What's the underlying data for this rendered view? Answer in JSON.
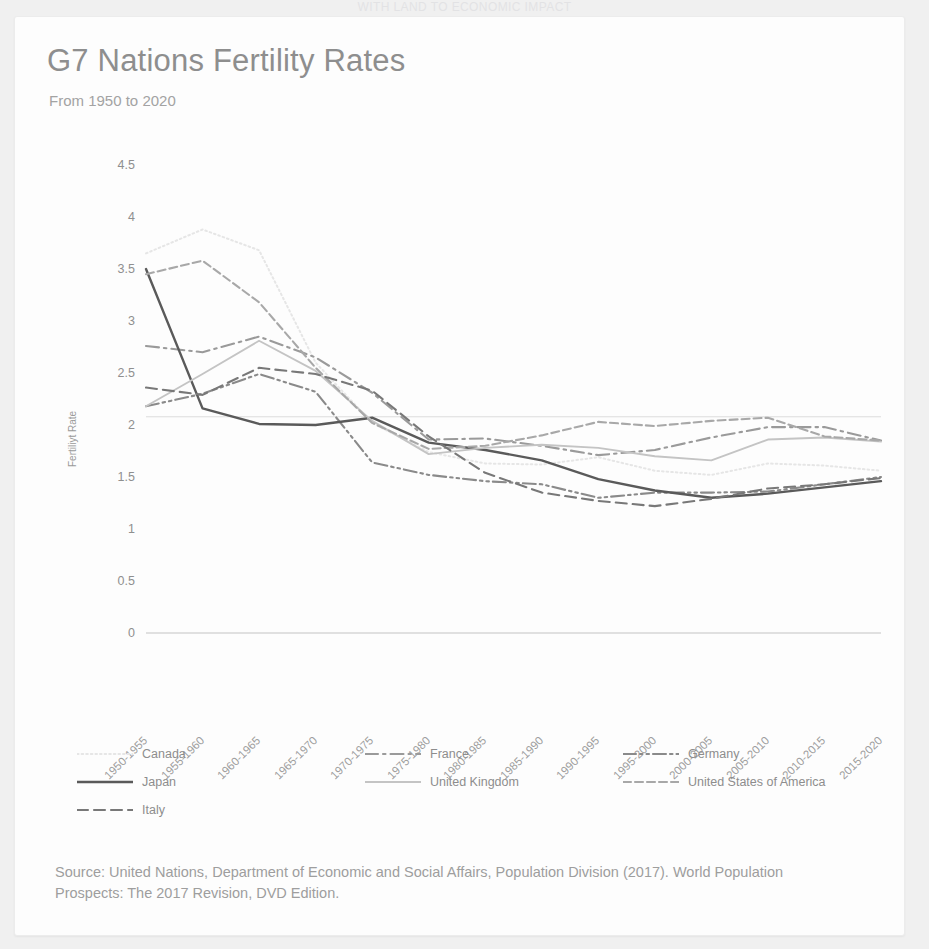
{
  "top_partial_text": "WITH LAND TO ECONOMIC IMPACT",
  "card": {
    "title": "G7 Nations Fertility Rates",
    "subtitle": "From 1950 to 2020",
    "source": "Source: United Nations, Department of Economic and Social Affairs, Population Division (2017). World Population Prospects: The 2017 Revision, DVD Edition."
  },
  "colors": {
    "canada": "#e6e6e6",
    "france": "#9a9a9a",
    "germany": "#8a8a8a",
    "japan": "#5a5a5a",
    "united_kingdom": "#c4c4c4",
    "usa": "#a8a8a8",
    "italy": "#787878",
    "axis": "#d6d6d6",
    "text": "#8f8f8f"
  },
  "chart_data": {
    "type": "line",
    "title": "G7 Nations Fertility Rates",
    "subtitle": "From 1950 to 2020",
    "xlabel": "",
    "ylabel": "Fertiliyt Rate",
    "ylim": [
      0,
      4.5
    ],
    "yticks": [
      0,
      0.5,
      1,
      1.5,
      2,
      2.5,
      3,
      3.5,
      4,
      4.5
    ],
    "grid": false,
    "legend_position": "bottom",
    "categories": [
      "1950-1955",
      "1955-1960",
      "1960-1965",
      "1965-1970",
      "1970-1975",
      "1975-1980",
      "1980-1985",
      "1985-1990",
      "1990-1995",
      "1995-2000",
      "2000-2005",
      "2005-2010",
      "2010-2015",
      "2015-2020"
    ],
    "series": [
      {
        "name": "Canada",
        "style": "dotted",
        "color": "#e6e6e6",
        "values": [
          3.65,
          3.88,
          3.68,
          2.6,
          2.02,
          1.74,
          1.63,
          1.62,
          1.69,
          1.56,
          1.52,
          1.63,
          1.61,
          1.56
        ]
      },
      {
        "name": "France",
        "style": "dash-dot",
        "color": "#9a9a9a",
        "values": [
          2.76,
          2.7,
          2.85,
          2.65,
          2.31,
          1.86,
          1.87,
          1.8,
          1.71,
          1.76,
          1.88,
          1.98,
          1.98,
          1.85
        ]
      },
      {
        "name": "Germany",
        "style": "dash-dot-dot",
        "color": "#8a8a8a",
        "values": [
          2.18,
          2.3,
          2.49,
          2.32,
          1.64,
          1.52,
          1.46,
          1.43,
          1.3,
          1.35,
          1.35,
          1.36,
          1.43,
          1.5
        ]
      },
      {
        "name": "Japan",
        "style": "solid",
        "color": "#5a5a5a",
        "values": [
          3.5,
          2.16,
          2.01,
          2.0,
          2.07,
          1.83,
          1.76,
          1.66,
          1.48,
          1.37,
          1.3,
          1.34,
          1.4,
          1.46
        ]
      },
      {
        "name": "United Kingdom",
        "style": "solid-light",
        "color": "#c4c4c4",
        "values": [
          2.18,
          2.49,
          2.81,
          2.52,
          2.04,
          1.72,
          1.78,
          1.81,
          1.78,
          1.7,
          1.66,
          1.86,
          1.88,
          1.84
        ]
      },
      {
        "name": "United States of America",
        "style": "dashed-long",
        "color": "#a8a8a8",
        "values": [
          3.45,
          3.58,
          3.18,
          2.55,
          2.02,
          1.77,
          1.8,
          1.9,
          2.03,
          1.99,
          2.04,
          2.07,
          1.89,
          1.85
        ]
      },
      {
        "name": "Italy",
        "style": "dashed",
        "color": "#787878",
        "values": [
          2.36,
          2.29,
          2.55,
          2.49,
          2.33,
          1.89,
          1.54,
          1.35,
          1.27,
          1.22,
          1.29,
          1.39,
          1.43,
          1.49
        ]
      }
    ]
  },
  "legend": {
    "rows": [
      [
        {
          "label": "Canada",
          "key": "canada",
          "style": "dotted"
        },
        {
          "label": "France",
          "key": "france",
          "style": "dash-dot"
        },
        {
          "label": "Germany",
          "key": "germany",
          "style": "dash-dot-dot"
        }
      ],
      [
        {
          "label": "Japan",
          "key": "japan",
          "style": "solid"
        },
        {
          "label": "United Kingdom",
          "key": "united_kingdom",
          "style": "solid-light"
        },
        {
          "label": "United States of America",
          "key": "usa",
          "style": "dashed-long"
        }
      ],
      [
        {
          "label": "Italy",
          "key": "italy",
          "style": "dashed"
        }
      ]
    ]
  }
}
